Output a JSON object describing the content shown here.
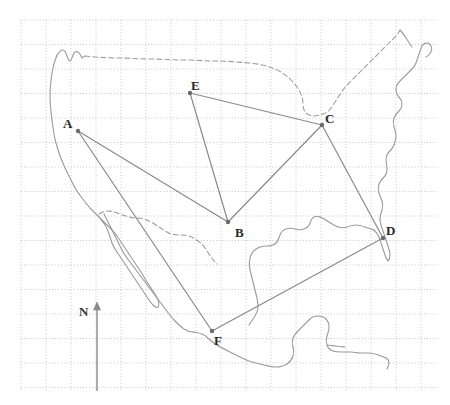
{
  "figure": {
    "type": "map-network-diagram",
    "width": 450,
    "height": 405,
    "background_color": "#ffffff",
    "region_name": "North America",
    "title": ""
  },
  "grid": {
    "visible": true,
    "style": "dotted",
    "color": "#c8c8c8",
    "cell_width": 25,
    "cell_height": 24.5,
    "origin_x": 21,
    "origin_y": 20,
    "extent_x": 437,
    "extent_y": 391,
    "columns": 17,
    "rows": 16
  },
  "coastline": {
    "color": "#9a9a9a",
    "stroke_width": 1.1,
    "style": "solid"
  },
  "borders": {
    "color": "#9a9a9a",
    "stroke_width": 1.1,
    "style": "dashed",
    "dash_pattern": "5,3",
    "names": [
      "usa-canada-border",
      "usa-mexico-border"
    ]
  },
  "network": {
    "line_color": "#8a8a8a",
    "line_width": 1.2,
    "node_color": "#6a6a6a",
    "node_radius": 2.2,
    "nodes": [
      {
        "id": "A",
        "label": "A",
        "x": 78,
        "y": 131,
        "label_x": 63,
        "label_y": 117
      },
      {
        "id": "B",
        "label": "B",
        "x": 228,
        "y": 222,
        "label_x": 235,
        "label_y": 226
      },
      {
        "id": "C",
        "label": "C",
        "x": 322,
        "y": 125,
        "label_x": 325,
        "label_y": 112
      },
      {
        "id": "D",
        "label": "D",
        "x": 383,
        "y": 238,
        "label_x": 386,
        "label_y": 224
      },
      {
        "id": "E",
        "label": "E",
        "x": 190,
        "y": 93,
        "label_x": 191,
        "label_y": 79
      },
      {
        "id": "F",
        "label": "F",
        "x": 212,
        "y": 331,
        "label_x": 214,
        "label_y": 334
      }
    ],
    "edges": [
      {
        "from": "A",
        "to": "B",
        "name": "edge-a-b"
      },
      {
        "from": "A",
        "to": "F",
        "name": "edge-a-f"
      },
      {
        "from": "E",
        "to": "B",
        "name": "edge-e-b"
      },
      {
        "from": "E",
        "to": "C",
        "name": "edge-e-c"
      },
      {
        "from": "C",
        "to": "B",
        "name": "edge-c-b"
      },
      {
        "from": "C",
        "to": "D",
        "name": "edge-c-d"
      },
      {
        "from": "D",
        "to": "F",
        "name": "edge-d-f"
      }
    ]
  },
  "compass": {
    "label": "N",
    "label_x": 79,
    "label_y": 305,
    "arrow_x": 97,
    "arrow_top_y": 302,
    "arrow_bottom_y": 391,
    "color": "#8a8a8a"
  }
}
